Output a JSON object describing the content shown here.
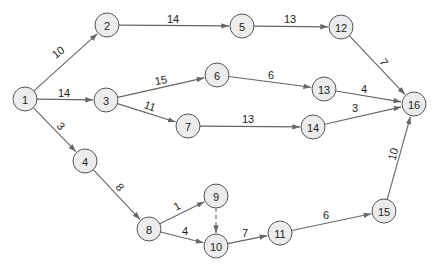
{
  "diagram": {
    "type": "activity-network",
    "colors": {
      "node_fill": "#ececec",
      "node_stroke": "#555555",
      "edge": "#666666",
      "text": "#222222"
    },
    "node_radius": 12,
    "nodes": [
      {
        "id": "1",
        "label": "1",
        "x": 25,
        "y": 99
      },
      {
        "id": "2",
        "label": "2",
        "x": 107,
        "y": 25
      },
      {
        "id": "3",
        "label": "3",
        "x": 106,
        "y": 100
      },
      {
        "id": "4",
        "label": "4",
        "x": 85,
        "y": 161
      },
      {
        "id": "5",
        "label": "5",
        "x": 242,
        "y": 26
      },
      {
        "id": "6",
        "label": "6",
        "x": 217,
        "y": 75
      },
      {
        "id": "7",
        "label": "7",
        "x": 188,
        "y": 126
      },
      {
        "id": "8",
        "label": "8",
        "x": 149,
        "y": 229
      },
      {
        "id": "9",
        "label": "9",
        "x": 216,
        "y": 196
      },
      {
        "id": "10",
        "label": "10",
        "x": 216,
        "y": 246
      },
      {
        "id": "11",
        "label": "11",
        "x": 280,
        "y": 233
      },
      {
        "id": "12",
        "label": "12",
        "x": 341,
        "y": 27
      },
      {
        "id": "13",
        "label": "13",
        "x": 324,
        "y": 89
      },
      {
        "id": "14",
        "label": "14",
        "x": 313,
        "y": 127
      },
      {
        "id": "15",
        "label": "15",
        "x": 384,
        "y": 211
      },
      {
        "id": "16",
        "label": "16",
        "x": 414,
        "y": 104
      }
    ],
    "edges": [
      {
        "from": "1",
        "to": "2",
        "weight": "10",
        "lx": 58,
        "ly": 52,
        "rot": -38
      },
      {
        "from": "1",
        "to": "3",
        "weight": "14",
        "lx": 64,
        "ly": 93,
        "rot": 0
      },
      {
        "from": "1",
        "to": "4",
        "weight": "3",
        "lx": 61,
        "ly": 126,
        "rot": 50
      },
      {
        "from": "2",
        "to": "5",
        "weight": "14",
        "lx": 173,
        "ly": 19,
        "rot": 0
      },
      {
        "from": "3",
        "to": "6",
        "weight": "15",
        "lx": 161,
        "ly": 80,
        "rot": -12
      },
      {
        "from": "3",
        "to": "7",
        "weight": "11",
        "lx": 150,
        "ly": 106,
        "rot": 20
      },
      {
        "from": "4",
        "to": "8",
        "weight": "8",
        "lx": 120,
        "ly": 187,
        "rot": 50
      },
      {
        "from": "5",
        "to": "12",
        "weight": "13",
        "lx": 290,
        "ly": 19,
        "rot": 0
      },
      {
        "from": "6",
        "to": "13",
        "weight": "6",
        "lx": 271,
        "ly": 75,
        "rot": 0
      },
      {
        "from": "7",
        "to": "14",
        "weight": "13",
        "lx": 248,
        "ly": 119,
        "rot": 0
      },
      {
        "from": "8",
        "to": "9",
        "weight": "1",
        "lx": 177,
        "ly": 206,
        "rot": -30
      },
      {
        "from": "8",
        "to": "10",
        "weight": "4",
        "lx": 185,
        "ly": 231,
        "rot": 0
      },
      {
        "from": "9",
        "to": "10",
        "weight": "",
        "lx": 0,
        "ly": 0,
        "rot": 0,
        "dashed": true
      },
      {
        "from": "10",
        "to": "11",
        "weight": "7",
        "lx": 245,
        "ly": 233,
        "rot": 0
      },
      {
        "from": "11",
        "to": "15",
        "weight": "6",
        "lx": 326,
        "ly": 215,
        "rot": 0
      },
      {
        "from": "12",
        "to": "16",
        "weight": "7",
        "lx": 384,
        "ly": 62,
        "rot": 55
      },
      {
        "from": "13",
        "to": "16",
        "weight": "4",
        "lx": 364,
        "ly": 89,
        "rot": 0
      },
      {
        "from": "14",
        "to": "16",
        "weight": "3",
        "lx": 355,
        "ly": 108,
        "rot": 0
      },
      {
        "from": "15",
        "to": "16",
        "weight": "10",
        "lx": 393,
        "ly": 154,
        "rot": -75
      }
    ]
  }
}
